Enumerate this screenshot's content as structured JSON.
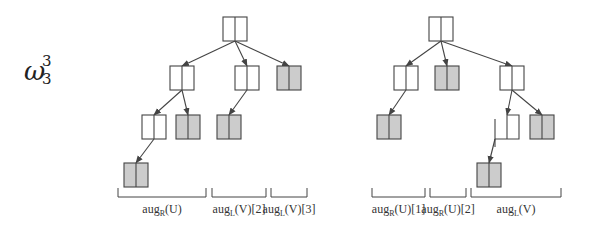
{
  "figure": {
    "title_symbol": "ω",
    "title_sup": "3",
    "title_sub": "3",
    "colors": {
      "line": "#444444",
      "node_fill": "#ffffff",
      "shaded_fill": "#cccccc",
      "text": "#333333"
    }
  },
  "trees": [
    {
      "name": "left-tree",
      "nodes": [
        {
          "id": "r",
          "x": 223,
          "y": 17,
          "shaded": false
        },
        {
          "id": "a",
          "x": 170,
          "y": 66,
          "shaded": false
        },
        {
          "id": "b",
          "x": 235,
          "y": 66,
          "shaded": false
        },
        {
          "id": "c",
          "x": 277,
          "y": 66,
          "shaded": true
        },
        {
          "id": "d",
          "x": 142,
          "y": 115,
          "shaded": false
        },
        {
          "id": "e",
          "x": 176,
          "y": 115,
          "shaded": true
        },
        {
          "id": "f",
          "x": 217,
          "y": 115,
          "shaded": true
        },
        {
          "id": "g",
          "x": 124,
          "y": 163,
          "shaded": true
        }
      ],
      "edges": [
        {
          "from": [
            235,
            41
          ],
          "to": [
            182,
            66
          ]
        },
        {
          "from": [
            235,
            41
          ],
          "to": [
            247,
            66
          ]
        },
        {
          "from": [
            235,
            41
          ],
          "to": [
            289,
            66
          ]
        },
        {
          "from": [
            182,
            90
          ],
          "to": [
            154,
            115
          ]
        },
        {
          "from": [
            182,
            90
          ],
          "to": [
            188,
            115
          ]
        },
        {
          "from": [
            247,
            90
          ],
          "to": [
            229,
            115
          ]
        },
        {
          "from": [
            154,
            139
          ],
          "to": [
            136,
            163
          ]
        }
      ],
      "brackets": [
        {
          "x1": 118,
          "x2": 206,
          "label": "aug",
          "sub": "R",
          "rest": "(U)"
        },
        {
          "x1": 212,
          "x2": 266,
          "label": "aug",
          "sub": "L",
          "rest": "(V)[2]"
        },
        {
          "x1": 271,
          "x2": 307,
          "label": "aug",
          "sub": "L",
          "rest": "(V)[3]"
        }
      ]
    },
    {
      "name": "right-tree",
      "nodes": [
        {
          "id": "r",
          "x": 429,
          "y": 17,
          "shaded": false
        },
        {
          "id": "h",
          "x": 394,
          "y": 66,
          "shaded": false
        },
        {
          "id": "i",
          "x": 435,
          "y": 66,
          "shaded": true
        },
        {
          "id": "j",
          "x": 500,
          "y": 66,
          "shaded": false
        },
        {
          "id": "k",
          "x": 377,
          "y": 115,
          "shaded": true
        },
        {
          "id": "l",
          "x": 495,
          "y": 115,
          "shaded": false,
          "open_left": true
        },
        {
          "id": "m",
          "x": 530,
          "y": 115,
          "shaded": true
        },
        {
          "id": "n",
          "x": 477,
          "y": 163,
          "shaded": true
        }
      ],
      "edges": [
        {
          "from": [
            441,
            41
          ],
          "to": [
            406,
            66
          ]
        },
        {
          "from": [
            441,
            41
          ],
          "to": [
            447,
            66
          ]
        },
        {
          "from": [
            441,
            41
          ],
          "to": [
            512,
            66
          ]
        },
        {
          "from": [
            406,
            90
          ],
          "to": [
            389,
            115
          ]
        },
        {
          "from": [
            512,
            90
          ],
          "to": [
            507,
            115
          ]
        },
        {
          "from": [
            512,
            90
          ],
          "to": [
            542,
            115
          ]
        },
        {
          "from": [
            495,
            139
          ],
          "to": [
            489,
            163
          ]
        }
      ],
      "brackets": [
        {
          "x1": 372,
          "x2": 425,
          "label": "aug",
          "sub": "R",
          "rest": "(U)[1]"
        },
        {
          "x1": 430,
          "x2": 466,
          "label": "aug",
          "sub": "R",
          "rest": "(U)[2]"
        },
        {
          "x1": 471,
          "x2": 561,
          "label": "aug",
          "sub": "L",
          "rest": "(V)"
        }
      ]
    }
  ]
}
